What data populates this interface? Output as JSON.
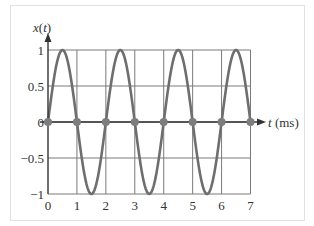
{
  "chart_data": {
    "type": "line",
    "title": "",
    "xlabel": "t (ms)",
    "ylabel": "x(t)",
    "xlim": [
      0,
      7
    ],
    "ylim": [
      -1,
      1
    ],
    "x_ticks": [
      "0",
      "1",
      "2",
      "3",
      "4",
      "5",
      "6",
      "7"
    ],
    "y_ticks": [
      "1",
      "0.5",
      "0",
      "−0.5",
      "−1"
    ],
    "grid": true,
    "series": [
      {
        "name": "x(t) = sin(πt)",
        "kind": "continuous",
        "period_ms": 2,
        "amplitude": 1,
        "x": [
          0,
          0.5,
          1,
          1.5,
          2,
          2.5,
          3,
          3.5,
          4,
          4.5,
          5,
          5.5,
          6,
          6.5,
          7
        ],
        "values": [
          0,
          1,
          0,
          -1,
          0,
          1,
          0,
          -1,
          0,
          1,
          0,
          -1,
          0,
          1,
          0
        ]
      },
      {
        "name": "samples",
        "kind": "points",
        "x": [
          0,
          1,
          2,
          3,
          4,
          5,
          6,
          7
        ],
        "values": [
          0,
          0,
          0,
          0,
          0,
          0,
          0,
          0
        ]
      }
    ],
    "colors": {
      "curve": "#6e6e6e",
      "grid": "#7a7a7a",
      "axis": "#333333",
      "samples": "#7d7d7d"
    }
  }
}
